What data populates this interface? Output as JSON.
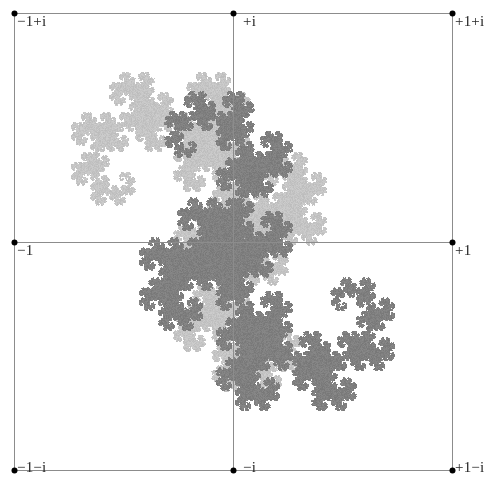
{
  "figure": {
    "background_color": "#ffffff",
    "width": 494,
    "height": 491
  },
  "axes": {
    "grid_color": "#8c8c8c",
    "grid_line_width": 1,
    "tick_dot_color": "#000000",
    "tick_dot_radius": 3,
    "x_grid_values": [
      -1,
      0,
      1
    ],
    "y_grid_values": [
      -1,
      0,
      1
    ],
    "x_pixels": [
      14,
      233,
      452
    ],
    "y_pixels": [
      13,
      242,
      470
    ],
    "label_color": "#262626",
    "label_font_size": 15
  },
  "labels": {
    "top_left": "−1+i",
    "top_center": "+i",
    "top_right": "+1+i",
    "mid_left": "−1",
    "mid_right": "+1",
    "bottom_left": "−1−i",
    "bottom_center": "−i",
    "bottom_right": "+1−i"
  },
  "chart_data": {
    "type": "scatter",
    "xlabel": "Re",
    "ylabel": "Im",
    "xlim": [
      -1,
      1
    ],
    "ylim": [
      -1,
      1
    ],
    "grid": true,
    "legend": "none",
    "x_tick_labels": [
      "−1",
      "0",
      "+1"
    ],
    "y_tick_labels": [
      "−i",
      "0",
      "+i"
    ],
    "corner_labels": [
      "−1+i",
      "+1+i",
      "−1−i",
      "+1−i"
    ],
    "series": [
      {
        "name": "dragon-light",
        "color": "#c2c2c2",
        "point_count": 260000,
        "ifs_maps": [
          {
            "a": 0.5,
            "b": -0.5,
            "c": 0.5,
            "d": 0.5,
            "e": 0.0,
            "f": 0.0
          },
          {
            "a": -0.5,
            "b": -0.5,
            "c": 0.5,
            "d": -0.5,
            "e": 1.0,
            "f": 0.0
          }
        ],
        "transform": {
          "scale": 0.33,
          "rotation_deg": -45,
          "tx": 0.02,
          "ty": 0.1
        }
      },
      {
        "name": "dragon-dark",
        "color": "#7d7d7d",
        "point_count": 260000,
        "ifs_maps": [
          {
            "a": 0.5,
            "b": -0.5,
            "c": 0.5,
            "d": 0.5,
            "e": 0.0,
            "f": 0.0
          },
          {
            "a": -0.5,
            "b": -0.5,
            "c": 0.5,
            "d": -0.5,
            "e": 1.0,
            "f": 0.0
          }
        ],
        "transform": {
          "scale": 0.33,
          "rotation_deg": 135,
          "tx": -0.02,
          "ty": -0.1
        }
      }
    ]
  }
}
